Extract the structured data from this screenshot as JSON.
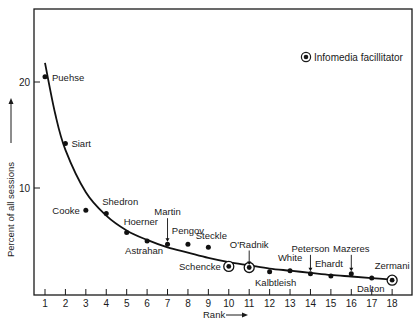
{
  "chart_data": {
    "type": "scatter",
    "title": "",
    "xlabel": "Rank",
    "ylabel": "Percent of all sessions",
    "xlim": [
      1,
      18
    ],
    "ylim": [
      0,
      20
    ],
    "x_ticks": [
      1,
      2,
      3,
      4,
      5,
      6,
      7,
      8,
      9,
      10,
      11,
      12,
      13,
      14,
      15,
      16,
      17,
      18
    ],
    "y_ticks": [
      10,
      20
    ],
    "grid": false,
    "legend": {
      "position": "top-right",
      "entries": [
        {
          "marker": "circled-dot",
          "label": "Infomedia facillitator"
        }
      ]
    },
    "points": [
      {
        "rank": 1,
        "name": "Puehse",
        "value": 20.5,
        "facilitator": false
      },
      {
        "rank": 2,
        "name": "Siart",
        "value": 14.2,
        "facilitator": false
      },
      {
        "rank": 3,
        "name": "Cooke",
        "value": 7.9,
        "facilitator": false
      },
      {
        "rank": 4,
        "name": "Shedron",
        "value": 7.6,
        "facilitator": false
      },
      {
        "rank": 5,
        "name": "Hoerner",
        "value": 5.8,
        "facilitator": false
      },
      {
        "rank": 6,
        "name": "Astrahan",
        "value": 5.0,
        "facilitator": false
      },
      {
        "rank": 7,
        "name": "Martin",
        "value": 4.7,
        "facilitator": false
      },
      {
        "rank": 8,
        "name": "Pengov",
        "value": 4.7,
        "facilitator": false
      },
      {
        "rank": 9,
        "name": "Steckle",
        "value": 4.4,
        "facilitator": false
      },
      {
        "rank": 10,
        "name": "Schencke",
        "value": 2.6,
        "facilitator": true
      },
      {
        "rank": 11,
        "name": "O'Radnik",
        "value": 2.5,
        "facilitator": true
      },
      {
        "rank": 12,
        "name": "Kalbtleish",
        "value": 2.1,
        "facilitator": false
      },
      {
        "rank": 13,
        "name": "White",
        "value": 2.2,
        "facilitator": false
      },
      {
        "rank": 14,
        "name": "Peterson",
        "value": 1.9,
        "facilitator": false
      },
      {
        "rank": 15,
        "name": "Ehardt",
        "value": 1.7,
        "facilitator": false
      },
      {
        "rank": 16,
        "name": "Mazeres",
        "value": 1.9,
        "facilitator": false
      },
      {
        "rank": 17,
        "name": "Dalton",
        "value": 1.5,
        "facilitator": false
      },
      {
        "rank": 18,
        "name": "Zermani",
        "value": 1.3,
        "facilitator": true
      }
    ],
    "fitted_curve": {
      "description": "Smooth decreasing (Zipf-like) curve through ranks",
      "x": [
        1,
        1.5,
        2,
        3,
        4,
        5,
        6,
        7,
        8,
        9,
        10,
        11,
        12,
        13,
        14,
        15,
        16,
        17,
        18
      ],
      "y": [
        21.8,
        17.0,
        13.6,
        9.6,
        7.4,
        6.0,
        5.1,
        4.4,
        3.9,
        3.4,
        3.0,
        2.7,
        2.4,
        2.2,
        2.0,
        1.8,
        1.65,
        1.5,
        1.35
      ]
    }
  },
  "labels": {
    "xlabel": "Rank",
    "ylabel": "Percent of all sessions",
    "legend": "Infomedia facillitator"
  }
}
